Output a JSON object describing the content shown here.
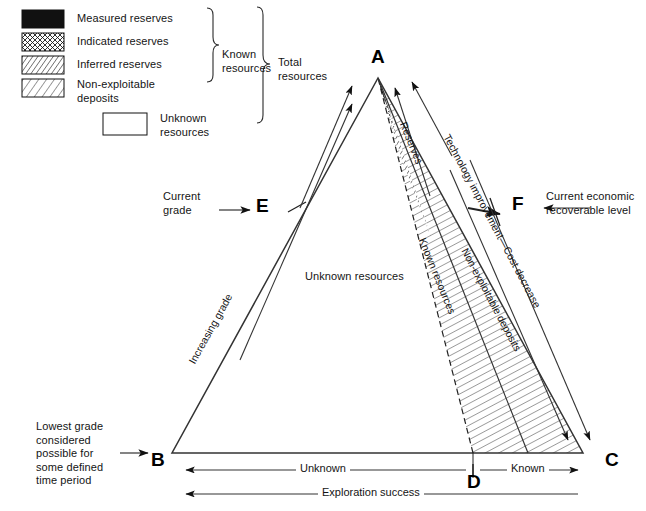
{
  "figure": {
    "kind": "mineral-resource-classification-triangle",
    "background": "#ffffff",
    "ink": "#141414"
  },
  "legend": {
    "swatches": [
      {
        "key": "measured",
        "label": "Measured reserves",
        "pattern": "solid-black"
      },
      {
        "key": "indicated",
        "label": "Indicated reserves",
        "pattern": "cross-hatch"
      },
      {
        "key": "inferred",
        "label": "Inferred reserves",
        "pattern": "dense-diagonal"
      },
      {
        "key": "nonexploitable",
        "label": "Non-exploitable\ndeposits",
        "pattern": "sparse-diagonal"
      },
      {
        "key": "unknown",
        "label": "Unknown\nresources",
        "pattern": "empty-box"
      }
    ],
    "brackets": [
      {
        "key": "known-resources",
        "label": "Known\nresources"
      },
      {
        "key": "total-resources",
        "label": "Total\nresources"
      }
    ]
  },
  "vertices": [
    {
      "key": "A",
      "label": "A",
      "x": 378,
      "y": 78,
      "text_x": 371,
      "text_y": 47
    },
    {
      "key": "B",
      "label": "B",
      "x": 172,
      "y": 453,
      "text_x": 151,
      "text_y": 450
    },
    {
      "key": "C",
      "label": "C",
      "x": 583,
      "y": 453,
      "text_x": 605,
      "text_y": 450
    },
    {
      "key": "D",
      "label": "D",
      "x": 473,
      "y": 453,
      "text_x": 467,
      "text_y": 472
    },
    {
      "key": "E",
      "label": "E",
      "x": 285,
      "y": 210,
      "text_x": 256,
      "text_y": 196
    },
    {
      "key": "F",
      "label": "F",
      "x": 520,
      "y": 208,
      "text_x": 512,
      "text_y": 194
    }
  ],
  "annotations": {
    "current_grade": "Current\ngrade",
    "current_economic": "Current economic\nrecoverable level",
    "lowest_grade": "Lowest grade\nconsidered\npossible for\nsome defined\ntime period",
    "unknown_resources_interior": "Unknown resources",
    "increasing_grade": "Increasing grade",
    "reserves": "Reserves",
    "known_resources_band": "Known resources",
    "technology": "Technology improvement—Cost decrease",
    "non_exploitable_band": "Non-exploitable deposits"
  },
  "axes": [
    {
      "key": "unknown-span",
      "label": "Unknown",
      "from": "B",
      "to": "D"
    },
    {
      "key": "known-span",
      "label": "Known",
      "from": "D",
      "to": "C"
    },
    {
      "key": "exploration",
      "label": "Exploration success",
      "from": "B",
      "to": "C"
    }
  ]
}
